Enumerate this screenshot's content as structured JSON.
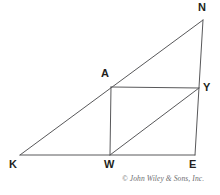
{
  "figure": {
    "type": "geometry-diagram",
    "background_color": "#ffffff",
    "line_color": "#58585a",
    "label_color": "#231f20",
    "points": {
      "N": {
        "label": "N",
        "x": 203,
        "y": 20
      },
      "A": {
        "label": "A",
        "x": 111,
        "y": 87
      },
      "Y": {
        "label": "Y",
        "x": 199,
        "y": 88
      },
      "K": {
        "label": "K",
        "x": 20,
        "y": 155
      },
      "W": {
        "label": "W",
        "x": 110,
        "y": 155
      },
      "E": {
        "label": "E",
        "x": 195,
        "y": 155
      }
    },
    "segments": [
      {
        "name": "K-N",
        "from": "K",
        "to": "N"
      },
      {
        "name": "N-E",
        "from": "N",
        "to": "E"
      },
      {
        "name": "K-E",
        "from": "K",
        "to": "E"
      },
      {
        "name": "A-Y",
        "from": "A",
        "to": "Y"
      },
      {
        "name": "A-W",
        "from": "A",
        "to": "W"
      },
      {
        "name": "W-Y",
        "from": "W",
        "to": "Y"
      }
    ]
  },
  "credit": {
    "text": "© John Wiley & Sons, Inc."
  }
}
